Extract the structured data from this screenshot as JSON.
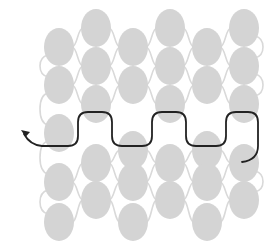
{
  "diagram": {
    "type": "beadwork-thread-path",
    "colors": {
      "background": "#ffffff",
      "bead": "#d4d4d4",
      "bead_link": "#d9d9d9",
      "thread": "#222222"
    },
    "bead_size": {
      "rx": 15,
      "ry": 19
    },
    "columns": [
      {
        "id": "A",
        "x": 59,
        "bead_y": [
          47,
          85,
          133,
          182,
          222
        ]
      },
      {
        "id": "B",
        "x": 96,
        "bead_y": [
          28,
          66,
          104,
          163,
          200
        ]
      },
      {
        "id": "C",
        "x": 133,
        "bead_y": [
          47,
          85,
          150,
          182,
          222
        ]
      },
      {
        "id": "D",
        "x": 170,
        "bead_y": [
          28,
          66,
          104,
          163,
          200
        ]
      },
      {
        "id": "E",
        "x": 207,
        "bead_y": [
          47,
          85,
          150,
          182,
          222
        ]
      },
      {
        "id": "F",
        "x": 244,
        "bead_y": [
          28,
          66,
          104,
          163,
          200
        ]
      }
    ],
    "thread_path": {
      "start": [
        242,
        162
      ],
      "end_arrow": [
        22,
        131
      ],
      "direction": "right-to-left"
    }
  }
}
